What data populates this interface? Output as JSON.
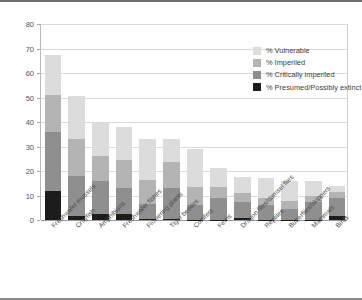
{
  "chart_data": {
    "type": "bar",
    "subtype": "stacked-vertical",
    "title": "",
    "xlabel": "",
    "ylabel": "",
    "ylim": [
      0,
      80
    ],
    "yticks": [
      0,
      10,
      20,
      30,
      40,
      50,
      60,
      70,
      80
    ],
    "ytick_labels": [
      "0",
      "10",
      "20",
      "30",
      "40",
      "50",
      "60",
      "70",
      "80"
    ],
    "grid": "horizontal",
    "legend_position": "top-right-inside",
    "categories": [
      "Freshwater mussels",
      "Crayfish",
      "Amphibians",
      "Freshwater fishes",
      "Flowering plants",
      "Tiger beetles",
      "Conifers",
      "Ferns",
      "Dragon flies/damsel flies",
      "Reptiles",
      "Butterflies/skippers",
      "Mammals",
      "Birds"
    ],
    "series": [
      {
        "name": "% Presumed/Possibly extinct",
        "color": "#1c1c1c",
        "values": [
          12.0,
          1.5,
          2.5,
          2.5,
          0.3,
          0.3,
          0.2,
          0.2,
          1.0,
          0.2,
          0.2,
          0.2,
          1.5
        ]
      },
      {
        "name": "% Critically imperiled",
        "color": "#8f8f8f",
        "values": [
          24.0,
          16.5,
          13.5,
          10.5,
          6.2,
          12.7,
          5.8,
          8.7,
          6.3,
          5.8,
          4.3,
          7.2,
          7.5
        ]
      },
      {
        "name": "% Imperiled",
        "color": "#b4b4b4",
        "values": [
          15.0,
          15.0,
          10.0,
          11.7,
          9.8,
          10.6,
          7.4,
          4.5,
          3.9,
          2.8,
          3.3,
          2.3,
          2.3
        ]
      },
      {
        "name": "% Vulnerable",
        "color": "#dcdcdc",
        "values": [
          16.5,
          17.5,
          13.5,
          13.3,
          16.7,
          9.4,
          15.6,
          7.8,
          6.3,
          8.2,
          8.2,
          6.3,
          2.7
        ]
      }
    ],
    "totals": [
      67.5,
      50.5,
      39.5,
      38.0,
      33.0,
      33.0,
      29.0,
      21.2,
      17.5,
      17.0,
      16.0,
      16.0,
      14.0
    ],
    "legend": [
      {
        "label": "% Vulnerable",
        "color": "#dcdcdc"
      },
      {
        "label": "% Imperiled",
        "color": "#b4b4b4"
      },
      {
        "label": "% Critically imperiled",
        "color": "#8f8f8f"
      },
      {
        "label": "% Presumed/Possibly extinct",
        "color": "#1c1c1c"
      }
    ]
  },
  "figure": {
    "background": "#ffffff",
    "gridline_color": "#d9d9d9",
    "axis_color": "#9a9a9a",
    "tick_label_color": "#555555"
  }
}
